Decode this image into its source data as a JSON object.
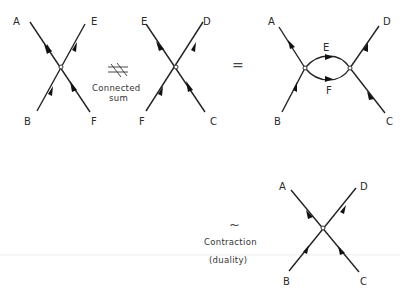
{
  "figure": {
    "background": "#ffffff",
    "line_color": "#222222",
    "diagrams": [
      {
        "id": "vertex-1",
        "labels": {
          "top_left": "A",
          "top_right": "E",
          "bottom_left": "B",
          "bottom_right": "F"
        }
      },
      {
        "id": "vertex-2",
        "labels": {
          "top_left": "E",
          "top_right": "D",
          "bottom_left": "F",
          "bottom_right": "C"
        }
      },
      {
        "id": "loop-diagram",
        "labels": {
          "top_left": "A",
          "top_right": "D",
          "bottom_left": "B",
          "bottom_right": "C",
          "loop_top": "E",
          "loop_bottom": "F"
        }
      },
      {
        "id": "contracted-vertex",
        "labels": {
          "top_left": "A",
          "top_right": "D",
          "bottom_left": "B",
          "bottom_right": "C"
        }
      }
    ],
    "operators": {
      "connected_sum_symbol": "#",
      "connected_sum_line1": "Connected",
      "connected_sum_line2": "sum",
      "equals": "=",
      "tilde": "~",
      "contraction_line1": "Contraction",
      "contraction_line2": "(duality)"
    }
  }
}
